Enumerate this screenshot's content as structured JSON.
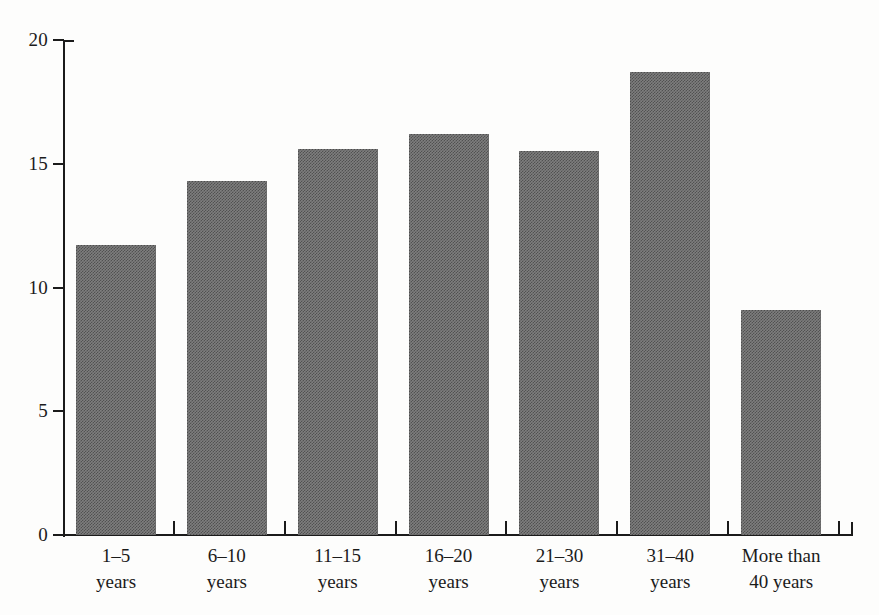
{
  "chart_data": {
    "type": "bar",
    "title": "",
    "subtitle": "",
    "xlabel": "",
    "ylabel": "",
    "categories": [
      "1–5 years",
      "6–10 years",
      "11–15 years",
      "16–20 years",
      "21–30 years",
      "31–40 years",
      "More than 40 years"
    ],
    "category_lines": [
      [
        "1–5",
        "years"
      ],
      [
        "6–10",
        "years"
      ],
      [
        "11–15",
        "years"
      ],
      [
        "16–20",
        "years"
      ],
      [
        "21–30",
        "years"
      ],
      [
        "31–40",
        "years"
      ],
      [
        "More than",
        "40 years"
      ]
    ],
    "values": [
      11.7,
      14.3,
      15.6,
      16.2,
      15.5,
      18.7,
      9.1
    ],
    "ylim": [
      0,
      20
    ],
    "yticks": [
      0,
      5,
      10,
      15,
      20
    ],
    "ytick_labels": [
      "0",
      "5",
      "10",
      "15",
      "20"
    ],
    "grid": false,
    "legend": false,
    "legend_position": "none",
    "bar_color": "#7e7e7e",
    "axis_color": "#1b1b1b",
    "background_color": "#fdfdfc"
  },
  "axis": {
    "y_tick_labels": [
      "20",
      "15",
      "10",
      "5",
      "0"
    ]
  }
}
